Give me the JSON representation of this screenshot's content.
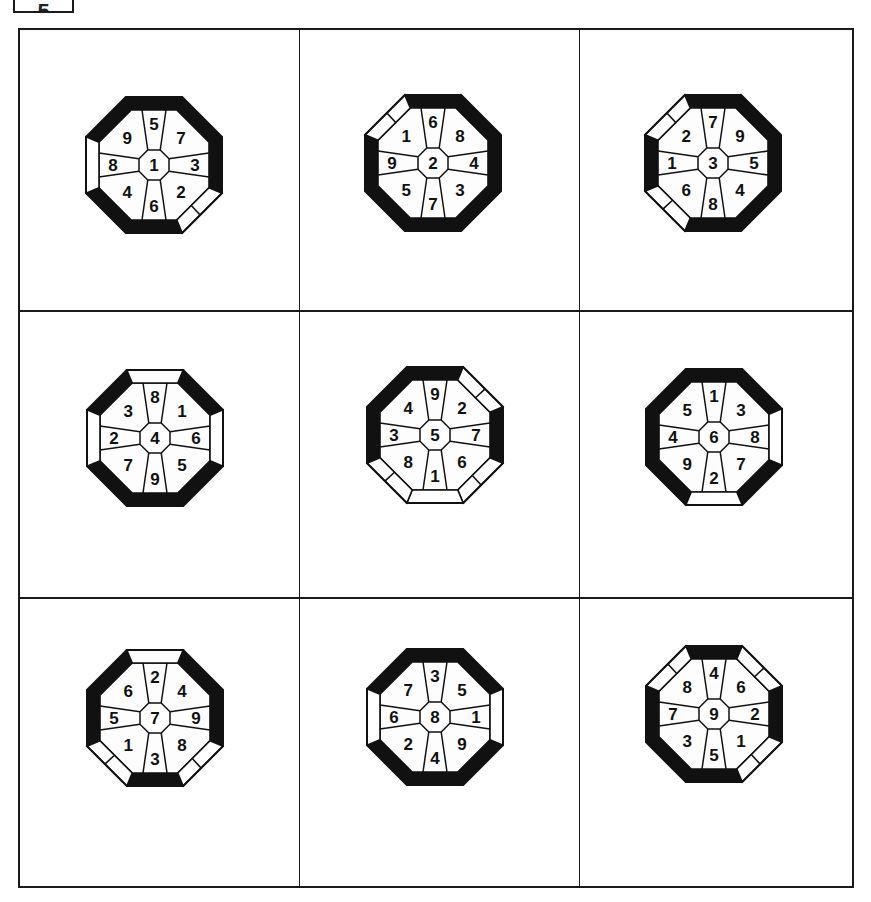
{
  "label_box": {
    "text": "5"
  },
  "grid": {
    "rows": 3,
    "cols": 3
  },
  "colors": {
    "ink": "#111111",
    "paper": "#ffffff",
    "sector_fill": "#fdfdfd"
  },
  "edge_order": [
    "top",
    "top-right",
    "right",
    "bottom-right",
    "bottom",
    "bottom-left",
    "left",
    "top-left"
  ],
  "octagons": [
    {
      "center": "1",
      "cx": 154,
      "cy": 165,
      "sectors": [
        "5",
        "7",
        "3",
        "2",
        "6",
        "4",
        "8",
        "9"
      ],
      "edges": [
        "black",
        "black",
        "black",
        "split",
        "black",
        "black",
        "white",
        "black"
      ]
    },
    {
      "center": "2",
      "cx": 433,
      "cy": 163,
      "sectors": [
        "6",
        "8",
        "4",
        "3",
        "7",
        "5",
        "9",
        "1"
      ],
      "edges": [
        "black",
        "black",
        "black",
        "black",
        "black",
        "black",
        "black",
        "split"
      ]
    },
    {
      "center": "3",
      "cx": 713,
      "cy": 163,
      "sectors": [
        "7",
        "9",
        "5",
        "4",
        "8",
        "6",
        "1",
        "2"
      ],
      "edges": [
        "black",
        "black",
        "black",
        "black",
        "black",
        "split",
        "black",
        "split"
      ]
    },
    {
      "center": "4",
      "cx": 155,
      "cy": 438,
      "sectors": [
        "8",
        "1",
        "6",
        "5",
        "9",
        "7",
        "2",
        "3"
      ],
      "edges": [
        "white",
        "black",
        "white",
        "black",
        "black",
        "black",
        "white",
        "black"
      ]
    },
    {
      "center": "5",
      "cx": 435,
      "cy": 435,
      "sectors": [
        "9",
        "2",
        "7",
        "6",
        "1",
        "8",
        "3",
        "4"
      ],
      "edges": [
        "black",
        "split",
        "black",
        "split",
        "white",
        "split",
        "black",
        "black"
      ]
    },
    {
      "center": "6",
      "cx": 714,
      "cy": 437,
      "sectors": [
        "1",
        "3",
        "8",
        "7",
        "2",
        "9",
        "4",
        "5"
      ],
      "edges": [
        "black",
        "black",
        "white",
        "black",
        "white",
        "black",
        "black",
        "black"
      ]
    },
    {
      "center": "7",
      "cx": 155,
      "cy": 718,
      "sectors": [
        "2",
        "4",
        "9",
        "8",
        "3",
        "1",
        "5",
        "6"
      ],
      "edges": [
        "white",
        "black",
        "black",
        "split",
        "black",
        "split",
        "black",
        "black"
      ]
    },
    {
      "center": "8",
      "cx": 435,
      "cy": 717,
      "sectors": [
        "3",
        "5",
        "1",
        "9",
        "4",
        "2",
        "6",
        "7"
      ],
      "edges": [
        "black",
        "black",
        "white",
        "black",
        "black",
        "black",
        "white",
        "black"
      ]
    },
    {
      "center": "9",
      "cx": 714,
      "cy": 714,
      "sectors": [
        "4",
        "6",
        "2",
        "1",
        "5",
        "3",
        "7",
        "8"
      ],
      "edges": [
        "black",
        "split",
        "black",
        "split",
        "black",
        "black",
        "black",
        "split"
      ]
    }
  ]
}
